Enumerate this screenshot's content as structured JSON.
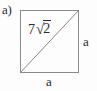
{
  "figure": {
    "part_label": "a)",
    "shape": "square",
    "background_color": "#fdfdfd",
    "line_color": "#8a8a8a",
    "text_color": "#2b2b2b",
    "labels": {
      "diagonal_coefficient": "7",
      "radical_sign": "√",
      "radicand": "2",
      "diagonal_full": "7√2",
      "right_side": "a",
      "bottom_side": "a"
    }
  }
}
